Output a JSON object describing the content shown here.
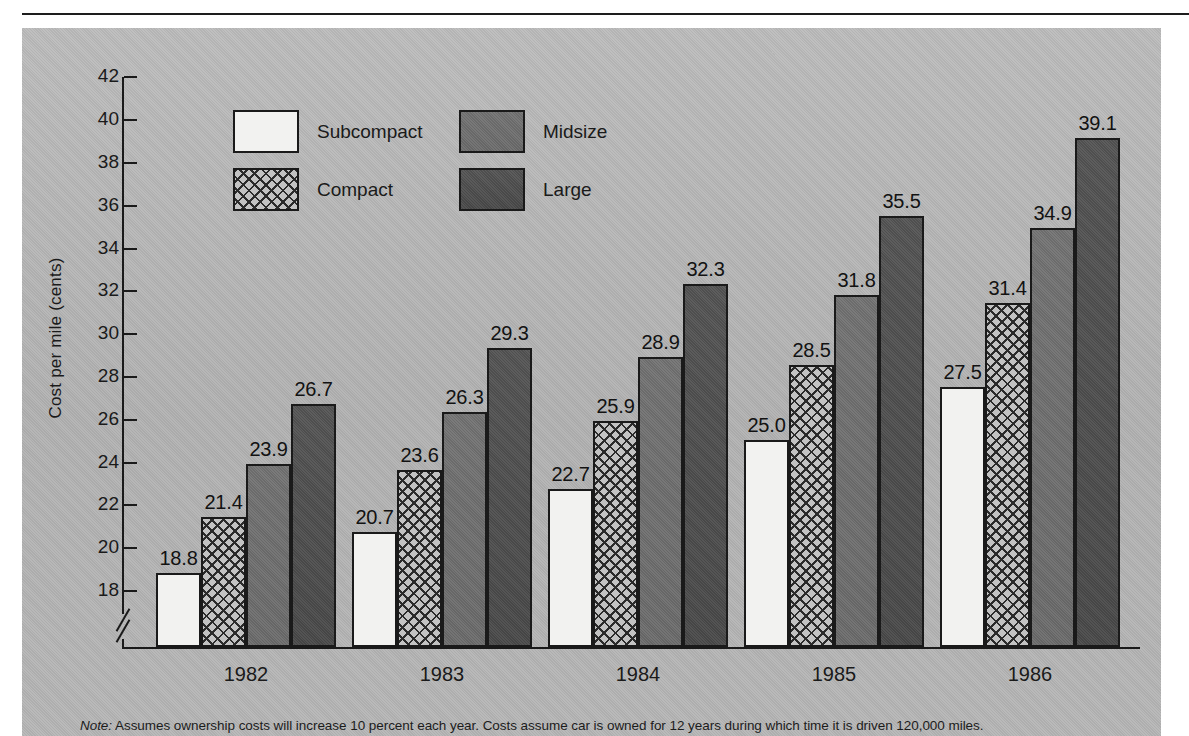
{
  "figure": {
    "note_label": "Note:",
    "note_text": " Assumes ownership costs will increase 10 percent each year. Costs assume car is owned for 12 years during which time it is driven 120,000 miles."
  },
  "legend": {
    "entries": [
      {
        "label": "Subcompact",
        "key": "subcompact",
        "color": "#f2f2f0"
      },
      {
        "label": "Compact",
        "key": "compact",
        "color": "#c2c2c2"
      },
      {
        "label": "Midsize",
        "key": "midsize",
        "color": "#6f6f6f"
      },
      {
        "label": "Large",
        "key": "large",
        "color": "#4f4f4f"
      }
    ]
  },
  "axes": {
    "y_title": "Cost per mile (cents)",
    "y_ticks": [
      "42",
      "40",
      "38",
      "36",
      "34",
      "32",
      "30",
      "28",
      "26",
      "24",
      "22",
      "20",
      "18"
    ],
    "x_labels": [
      "1982",
      "1983",
      "1984",
      "1985",
      "1986"
    ],
    "has_axis_break": true
  },
  "chart_data": {
    "type": "bar",
    "title": "",
    "xlabel": "",
    "ylabel": "Cost per mile (cents)",
    "categories": [
      "1982",
      "1983",
      "1984",
      "1985",
      "1986"
    ],
    "ylim": [
      17.3,
      43.0
    ],
    "y_ticks": [
      18,
      20,
      22,
      24,
      26,
      28,
      30,
      32,
      34,
      36,
      38,
      40,
      42
    ],
    "axis_break": true,
    "grid": false,
    "legend_position": "upper-left-inside",
    "series": [
      {
        "name": "Subcompact",
        "color": "#f2f2f0",
        "values": [
          18.8,
          20.7,
          22.7,
          25.0,
          27.5
        ]
      },
      {
        "name": "Compact",
        "color": "#c2c2c2",
        "values": [
          21.4,
          23.6,
          25.9,
          28.5,
          31.4
        ]
      },
      {
        "name": "Midsize",
        "color": "#6f6f6f",
        "values": [
          23.9,
          26.3,
          28.9,
          31.8,
          34.9
        ]
      },
      {
        "name": "Large",
        "color": "#4f4f4f",
        "values": [
          26.7,
          29.3,
          32.3,
          35.5,
          39.1
        ]
      }
    ],
    "data_labels": [
      [
        "18.8",
        "21.4",
        "23.9",
        "26.7"
      ],
      [
        "20.7",
        "23.6",
        "26.3",
        "29.3"
      ],
      [
        "22.7",
        "25.9",
        "28.9",
        "32.3"
      ],
      [
        "25.0",
        "28.5",
        "31.8",
        "35.5"
      ],
      [
        "27.5",
        "31.4",
        "34.9",
        "39.1"
      ]
    ]
  }
}
